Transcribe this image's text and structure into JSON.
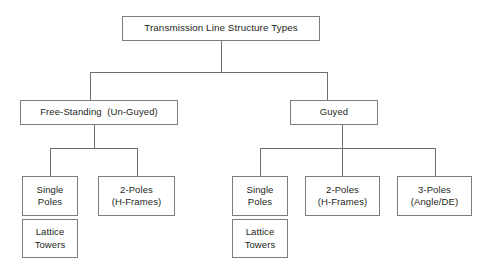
{
  "diagram": {
    "title": "Transmission Line Structure Types",
    "root": {
      "label": "Transmission Line Structure Types"
    },
    "level2": [
      {
        "label": "Free-Standing  (Un-Guyed)"
      },
      {
        "label": "Guyed"
      }
    ],
    "level3_left": [
      {
        "line1": "Single",
        "line2": "Poles"
      },
      {
        "line1": "2-Poles",
        "line2": "(H-Frames)"
      }
    ],
    "level3_left_extra": [
      {
        "line1": "Lattice",
        "line2": "Towers"
      }
    ],
    "level3_right": [
      {
        "line1": "Single",
        "line2": "Poles"
      },
      {
        "line1": "2-Poles",
        "line2": "(H-Frames)"
      },
      {
        "line1": "3-Poles",
        "line2": "(Angle/DE)"
      }
    ],
    "level3_right_extra": [
      {
        "line1": "Lattice",
        "line2": "Towers"
      }
    ],
    "colors": {
      "background": "#ffffff",
      "box_border": "#7d7d7d",
      "connector": "#6f6f6f",
      "text": "#231f20"
    }
  }
}
